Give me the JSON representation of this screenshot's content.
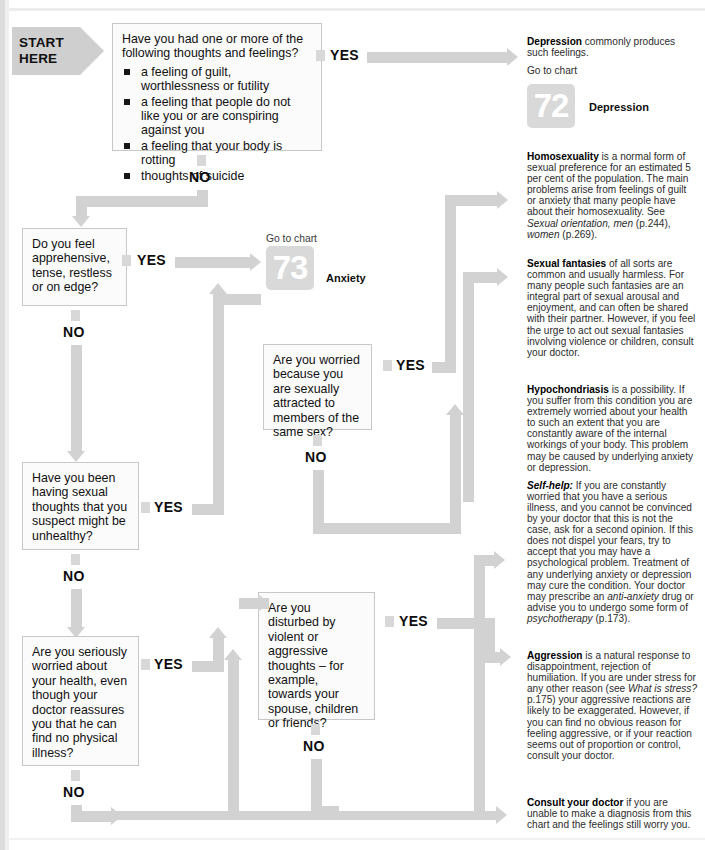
{
  "start": {
    "line1": "START",
    "line2": "HERE"
  },
  "labels": {
    "yes": "YES",
    "no": "NO",
    "go_to_chart": "Go to chart"
  },
  "questions": {
    "q1": {
      "stem_line1": "Have you had one or more of the",
      "stem_line2": "following thoughts and feelings?",
      "bullets": [
        "a feeling of guilt, worthlessness or futility",
        "a feeling that people do not like you or are conspiring against you",
        "a feeling that your body is rotting",
        "thoughts of suicide"
      ]
    },
    "q2": {
      "text": "Do you feel apprehensive, tense, restless or on edge?"
    },
    "q3": {
      "text": "Are you worried because you are sexually attracted to members of the same sex?"
    },
    "q4": {
      "text": "Have you been having sexual thoughts that you suspect might be unhealthy?"
    },
    "q5": {
      "text": "Are you seriously worried about your health, even though your doctor reassures you that he can find no physical illness?"
    },
    "q6": {
      "text": "Are you disturbed by violent or aggressive thoughts – for example, towards your spouse, children or friends?"
    }
  },
  "charts": [
    {
      "number": "72",
      "name": "Depression"
    },
    {
      "number": "73",
      "name": "Anxiety"
    }
  ],
  "answers": {
    "depression": {
      "title": "Depression",
      "body": " commonly produces such feelings.",
      "goto": "Go to chart"
    },
    "homosexuality": {
      "title": "Homosexuality",
      "body_1": " is a normal form of sexual preference for an estimated 5 per cent of the population. The main problems arise from feelings of guilt or anxiety that many people have about their homosexuality. See ",
      "ref_italic": "Sexual orientation, men",
      "ref_mid": " (p.244), ",
      "ref_italic2": "women",
      "ref_end": " (p.269)."
    },
    "fantasies": {
      "title": "Sexual fantasies",
      "body": " of all sorts are common and usually harmless. For many people such fantasies are an integral part of sexual arousal and enjoyment, and can often be shared with their partner. However, if you feel the urge to act out sexual fantasies involving violence or children, consult your doctor."
    },
    "hypochondriasis": {
      "title": "Hypochondriasis",
      "body_1": " is a possibility. If you suffer from this condition you are extremely worried about your health to such an extent that you are constantly aware of the internal workings of your body. This problem may be caused by underlying anxiety or depression.",
      "selfhelp_label": "Self-help:",
      "body_2": " If you are constantly worried that you have a serious illness, and you cannot be convinced by your doctor that this is not the case, ask for a second opinion. If this does not dispel your fears, try to accept that you may have a psychological problem. Treatment of any underlying anxiety or depression may cure the condition. Your doctor may prescribe an ",
      "drug_italic": "anti-anxiety",
      "body_3": " drug or advise you to undergo some form of ",
      "therapy_italic": "psychotherapy",
      "body_4": " (p.173)."
    },
    "aggression": {
      "title": "Aggression",
      "body_1": " is a natural response to disappointment, rejection of humiliation. If you are under stress for any other reason (see ",
      "ref_italic": "What is stress?",
      "body_2": " p.175) your aggressive reactions are likely to be exaggerated. However, if you can find no obvious reason for feeling aggressive, or if your reaction seems out of proportion or control, consult your doctor."
    },
    "consult": {
      "title": "Consult your doctor",
      "body": " if you are unable to make a diagnosis from this chart and the feelings still worry you."
    }
  },
  "colors": {
    "flow_grey": "#d2d2d2",
    "box_fill": "#fbfbfb",
    "box_border": "#c8c8c8",
    "chart_badge": "#d9d9d9"
  }
}
